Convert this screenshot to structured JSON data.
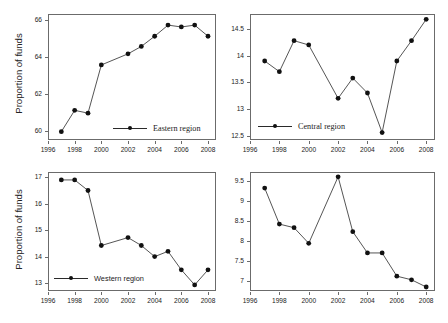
{
  "figure": {
    "ylabel": "Proportion of funds",
    "xticks": [
      1996,
      1998,
      2000,
      2002,
      2004,
      2006,
      2008
    ],
    "xlim": [
      1996,
      2008.6
    ]
  },
  "chart_data": [
    {
      "type": "line",
      "title": "",
      "legend": "Eastern region",
      "legend_position": "bottom-center",
      "xlabel": "",
      "ylabel": "Proportion of funds",
      "x": [
        1997,
        1998,
        1999,
        2000,
        2002,
        2003,
        2004,
        2005,
        2006,
        2007,
        2008
      ],
      "values": [
        59.95,
        61.1,
        60.95,
        63.55,
        64.15,
        64.55,
        65.1,
        65.7,
        65.6,
        65.7,
        65.1
      ],
      "yticks": [
        60,
        62,
        64,
        66
      ],
      "ylim": [
        59.5,
        66.3
      ],
      "xlim": [
        1996,
        2008.6
      ],
      "grid": false,
      "marker": "filled-circle",
      "line_color": "#2a2a2a",
      "marker_color": "#111111"
    },
    {
      "type": "line",
      "title": "",
      "legend": "Central region",
      "legend_position": "bottom-left",
      "xlabel": "",
      "ylabel": "",
      "x": [
        1997,
        1998,
        1999,
        2000,
        2002,
        2003,
        2004,
        2005,
        2006,
        2007,
        2008
      ],
      "values": [
        13.9,
        13.7,
        14.28,
        14.2,
        13.2,
        13.58,
        13.3,
        12.56,
        13.9,
        14.28,
        14.68
      ],
      "yticks": [
        12.5,
        13,
        13.5,
        14,
        14.5
      ],
      "ylim": [
        12.42,
        14.78
      ],
      "xlim": [
        1996,
        2008.6
      ],
      "grid": false,
      "marker": "filled-circle",
      "line_color": "#2a2a2a",
      "marker_color": "#111111"
    },
    {
      "type": "line",
      "title": "",
      "legend": "Western region",
      "legend_position": "bottom-left",
      "xlabel": "",
      "ylabel": "Proportion of funds",
      "x": [
        1997,
        1998,
        1999,
        2000,
        2002,
        2003,
        2004,
        2005,
        2006,
        2007,
        2008
      ],
      "values": [
        16.9,
        16.9,
        16.5,
        14.42,
        14.72,
        14.42,
        14.0,
        14.2,
        13.5,
        12.93,
        13.5
      ],
      "yticks": [
        13,
        14,
        15,
        16,
        17
      ],
      "ylim": [
        12.7,
        17.2
      ],
      "xlim": [
        1996,
        2008.6
      ],
      "grid": false,
      "marker": "filled-circle",
      "line_color": "#2a2a2a",
      "marker_color": "#111111"
    },
    {
      "type": "line",
      "title": "",
      "legend": "Northeastern region",
      "legend_position": "bottom-left",
      "xlabel": "",
      "ylabel": "",
      "x": [
        1997,
        1998,
        1999,
        2000,
        2002,
        2003,
        2004,
        2005,
        2006,
        2007,
        2008
      ],
      "values": [
        9.32,
        8.42,
        8.33,
        7.94,
        9.6,
        8.23,
        7.7,
        7.7,
        7.12,
        7.03,
        6.85
      ],
      "yticks": [
        7,
        7.5,
        8,
        8.5,
        9,
        9.5
      ],
      "ylim": [
        6.75,
        9.72
      ],
      "xlim": [
        1996,
        2008.6
      ],
      "grid": false,
      "marker": "filled-circle",
      "line_color": "#2a2a2a",
      "marker_color": "#111111"
    }
  ]
}
